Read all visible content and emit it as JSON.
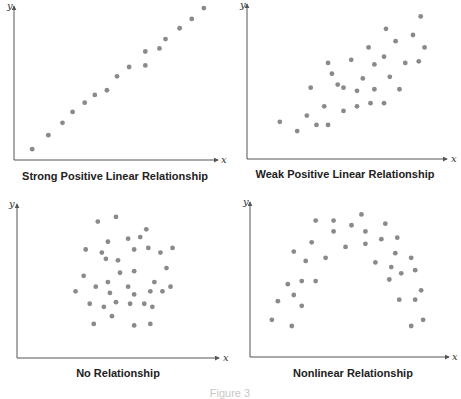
{
  "figure_caption": "Figure 3",
  "colors": {
    "point": "#8a8a8a",
    "axis": "#555555",
    "caption": "#222222",
    "figure_caption": "#c8c8c8"
  },
  "chart_data": [
    {
      "type": "scatter",
      "title": "Strong Positive Linear Relationship",
      "xlabel": "x",
      "ylabel": "y",
      "xlim": [
        0,
        100
      ],
      "ylim": [
        0,
        100
      ],
      "grid": false,
      "points": [
        [
          9,
          7
        ],
        [
          17,
          16
        ],
        [
          24,
          24
        ],
        [
          29,
          31
        ],
        [
          35,
          37
        ],
        [
          40,
          42
        ],
        [
          46,
          45
        ],
        [
          51,
          54
        ],
        [
          57,
          60
        ],
        [
          65,
          61
        ],
        [
          65,
          70
        ],
        [
          72,
          72
        ],
        [
          75,
          78
        ],
        [
          82,
          85
        ],
        [
          88,
          91
        ],
        [
          94,
          98
        ]
      ]
    },
    {
      "type": "scatter",
      "title": "Weak Positive Linear Relationship",
      "xlabel": "x",
      "ylabel": "y",
      "xlim": [
        0,
        100
      ],
      "ylim": [
        0,
        100
      ],
      "grid": false,
      "points": [
        [
          17,
          24
        ],
        [
          26,
          18
        ],
        [
          31,
          28
        ],
        [
          36,
          22
        ],
        [
          33,
          46
        ],
        [
          40,
          34
        ],
        [
          42,
          22
        ],
        [
          42,
          62
        ],
        [
          44,
          55
        ],
        [
          47,
          48
        ],
        [
          50,
          31
        ],
        [
          50,
          46
        ],
        [
          54,
          64
        ],
        [
          57,
          44
        ],
        [
          57,
          34
        ],
        [
          60,
          52
        ],
        [
          63,
          72
        ],
        [
          64,
          36
        ],
        [
          66,
          45
        ],
        [
          66,
          61
        ],
        [
          71,
          36
        ],
        [
          71,
          66
        ],
        [
          72,
          84
        ],
        [
          74,
          53
        ],
        [
          77,
          76
        ],
        [
          79,
          45
        ],
        [
          82,
          62
        ],
        [
          86,
          80
        ],
        [
          89,
          63
        ],
        [
          90,
          92
        ],
        [
          92,
          72
        ]
      ]
    },
    {
      "type": "scatter",
      "title": "No Relationship",
      "xlabel": "x",
      "ylabel": "y",
      "xlim": [
        0,
        100
      ],
      "ylim": [
        0,
        100
      ],
      "grid": false,
      "points": [
        [
          40,
          88
        ],
        [
          49,
          91
        ],
        [
          64,
          83
        ],
        [
          34,
          70
        ],
        [
          42,
          68
        ],
        [
          45,
          75
        ],
        [
          55,
          77
        ],
        [
          61,
          78
        ],
        [
          58,
          70
        ],
        [
          65,
          71
        ],
        [
          71,
          68
        ],
        [
          77,
          71
        ],
        [
          44,
          64
        ],
        [
          50,
          63
        ],
        [
          33,
          53
        ],
        [
          51,
          55
        ],
        [
          58,
          56
        ],
        [
          74,
          58
        ],
        [
          68,
          49
        ],
        [
          45,
          49
        ],
        [
          39,
          46
        ],
        [
          55,
          46
        ],
        [
          29,
          43
        ],
        [
          46,
          42
        ],
        [
          58,
          41
        ],
        [
          66,
          43
        ],
        [
          72,
          43
        ],
        [
          76,
          46
        ],
        [
          36,
          35
        ],
        [
          43,
          33
        ],
        [
          49,
          36
        ],
        [
          56,
          35
        ],
        [
          63,
          35
        ],
        [
          67,
          33
        ],
        [
          47,
          27
        ],
        [
          38,
          22
        ],
        [
          58,
          21
        ],
        [
          66,
          22
        ]
      ]
    },
    {
      "type": "scatter",
      "title": "Nonlinear Relationship",
      "xlabel": "x",
      "ylabel": "y",
      "xlim": [
        0,
        100
      ],
      "ylim": [
        0,
        100
      ],
      "grid": false,
      "points": [
        [
          11,
          24
        ],
        [
          14,
          36
        ],
        [
          19,
          47
        ],
        [
          21,
          20
        ],
        [
          22,
          68
        ],
        [
          22,
          40
        ],
        [
          26,
          33
        ],
        [
          26,
          49
        ],
        [
          28,
          62
        ],
        [
          31,
          74
        ],
        [
          33,
          88
        ],
        [
          33,
          49
        ],
        [
          38,
          64
        ],
        [
          42,
          88
        ],
        [
          42,
          81
        ],
        [
          48,
          71
        ],
        [
          51,
          85
        ],
        [
          56,
          92
        ],
        [
          58,
          81
        ],
        [
          58,
          73
        ],
        [
          63,
          61
        ],
        [
          66,
          76
        ],
        [
          68,
          86
        ],
        [
          70,
          50
        ],
        [
          71,
          58
        ],
        [
          73,
          67
        ],
        [
          74,
          77
        ],
        [
          75,
          37
        ],
        [
          76,
          54
        ],
        [
          81,
          64
        ],
        [
          81,
          20
        ],
        [
          83,
          37
        ],
        [
          83,
          56
        ],
        [
          86,
          43
        ],
        [
          87,
          24
        ]
      ]
    }
  ]
}
